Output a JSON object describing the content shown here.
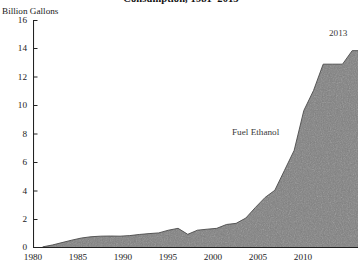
{
  "chart_data": {
    "type": "area",
    "title": "Consumption, 1981–2013",
    "ylabel": "Billion Gallons",
    "xlabel": "",
    "xlim": [
      1980,
      2013.6
    ],
    "ylim": [
      0,
      16
    ],
    "grid": false,
    "legend_position": "inline-annotation",
    "series_name": "Fuel Ethanol",
    "fill_color": "#808080",
    "line_color": "#4a4a4a",
    "axis_color": "#222222",
    "annotations": [
      {
        "text": "Fuel Ethanol",
        "x": 2003,
        "y": 7.2
      },
      {
        "text": "2013",
        "x": 2012.4,
        "y": 15.2
      }
    ],
    "yticks": [
      0,
      2,
      4,
      6,
      8,
      10,
      12,
      14,
      16
    ],
    "ytick_labels": [
      "0",
      "2",
      "4",
      "6",
      "8",
      "10",
      "12",
      "14",
      "16"
    ],
    "xticks": [
      1980,
      1985,
      1990,
      1995,
      2000,
      2005,
      2010
    ],
    "xtick_labels": [
      "1980",
      "1985",
      "1990",
      "1995",
      "2000",
      "2005",
      "2010"
    ],
    "x": [
      1981,
      1982,
      1983,
      1984,
      1985,
      1986,
      1987,
      1988,
      1989,
      1990,
      1991,
      1992,
      1993,
      1994,
      1995,
      1996,
      1997,
      1998,
      1999,
      2000,
      2001,
      2002,
      2003,
      2004,
      2005,
      2006,
      2007,
      2008,
      2009,
      2010,
      2011,
      2012,
      2013
    ],
    "values": [
      0.08,
      0.21,
      0.38,
      0.55,
      0.7,
      0.79,
      0.83,
      0.84,
      0.83,
      0.87,
      0.95,
      1.01,
      1.06,
      1.25,
      1.38,
      0.96,
      1.25,
      1.32,
      1.38,
      1.65,
      1.73,
      2.1,
      2.85,
      3.55,
      4.05,
      5.45,
      6.85,
      9.65,
      11.05,
      12.9,
      12.9,
      12.9,
      13.85
    ],
    "units": "billion gallons"
  },
  "figure": {
    "title": "Consumption, 1981–2013",
    "axis_caption": "Billion Gallons"
  }
}
